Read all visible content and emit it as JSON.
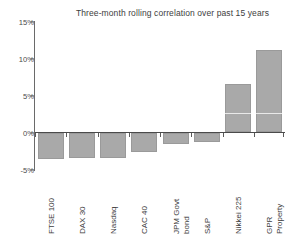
{
  "chart_data": {
    "type": "bar",
    "title": "Three-month rolling correlation over past 15 years",
    "xlabel": "",
    "ylabel": "",
    "ylim": [
      -5,
      15
    ],
    "yticks": [
      "-5%",
      "0%",
      "5%",
      "10%",
      "15%"
    ],
    "ytick_values": [
      -5,
      0,
      5,
      10,
      15
    ],
    "grid": false,
    "legend": "none",
    "categories": [
      "FTSE 100",
      "DAX 30",
      "Nasdaq",
      "CAC 40",
      "JPM Govt\nbond",
      "S&P",
      "Nikkei 225",
      "GPR\nProperty"
    ],
    "values": [
      -3.6,
      -3.5,
      -3.4,
      -2.6,
      -1.6,
      -1.3,
      6.6,
      11.1
    ],
    "value_unit": "%",
    "bar_color": "#a9a9a9",
    "axis_color": "#4a4a4a"
  }
}
